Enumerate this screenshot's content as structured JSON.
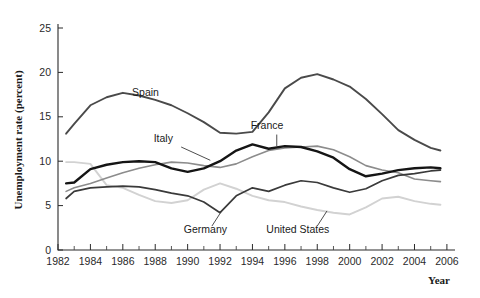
{
  "chart_data": {
    "type": "line",
    "title": "",
    "xlabel": "Year",
    "ylabel": "Unemployment rate (percent)",
    "xlim": [
      1982,
      2006.5
    ],
    "ylim": [
      0,
      25
    ],
    "yticks": [
      0,
      5,
      10,
      15,
      20,
      25
    ],
    "ytick_labels": [
      "0",
      "5",
      "10",
      "15",
      "20",
      "25"
    ],
    "xticks": [
      1982,
      1984,
      1986,
      1988,
      1990,
      1992,
      1994,
      1996,
      1998,
      2000,
      2002,
      2004,
      2006
    ],
    "xtick_labels": [
      "1982",
      "1984",
      "1986",
      "1988",
      "1990",
      "1992",
      "1994",
      "1996",
      "1998",
      "2000",
      "2002",
      "2004",
      "2006"
    ],
    "xtick_minor_step": 1,
    "grid": false,
    "legend_position": "inline-annotations",
    "x": [
      1982.5,
      1983,
      1984,
      1985,
      1986,
      1987,
      1988,
      1989,
      1990,
      1991,
      1992,
      1993,
      1994,
      1995,
      1996,
      1997,
      1998,
      1999,
      2000,
      2001,
      2002,
      2003,
      2004,
      2005,
      2005.6
    ],
    "series": [
      {
        "name": "Spain",
        "color": "#4a4a4a",
        "width": 1.9,
        "label": "Spain",
        "label_x": 1987.4,
        "label_y": 17.3,
        "values": [
          13.1,
          14.2,
          16.3,
          17.2,
          17.7,
          17.4,
          16.9,
          16.3,
          15.4,
          14.4,
          13.2,
          13.1,
          13.3,
          15.5,
          18.2,
          19.4,
          19.8,
          19.2,
          18.4,
          17.0,
          15.3,
          13.5,
          12.4,
          11.5,
          11.2
        ],
        "values_label_hint": "peaks 19.8 in 1994"
      },
      {
        "name": "Italy",
        "color": "#8c8c8c",
        "width": 1.6,
        "label": "Italy",
        "label_x": 1988.5,
        "label_y": 12.2,
        "values": [
          6.6,
          7.0,
          7.5,
          8.1,
          8.7,
          9.2,
          9.6,
          9.9,
          9.8,
          9.5,
          9.3,
          9.7,
          10.5,
          11.2,
          11.5,
          11.6,
          11.7,
          11.3,
          10.5,
          9.5,
          9.0,
          8.7,
          8.0,
          7.8,
          7.7
        ]
      },
      {
        "name": "France",
        "color": "#151515",
        "width": 2.4,
        "label": "France",
        "label_x": 1994.9,
        "label_y": 13.6,
        "values": [
          7.5,
          7.6,
          9.1,
          9.6,
          9.9,
          10.0,
          9.9,
          9.2,
          8.8,
          9.2,
          10.0,
          11.2,
          11.9,
          11.4,
          11.7,
          11.6,
          11.1,
          10.4,
          9.1,
          8.3,
          8.6,
          9.0,
          9.2,
          9.3,
          9.2
        ]
      },
      {
        "name": "Germany",
        "color": "#3a3a3a",
        "width": 1.7,
        "label": "Germany",
        "label_x": 1991.1,
        "label_y": 1.9,
        "values": [
          5.8,
          6.6,
          7.0,
          7.1,
          7.2,
          7.1,
          6.8,
          6.4,
          6.1,
          5.4,
          4.2,
          6.1,
          7.0,
          6.6,
          7.3,
          7.8,
          7.6,
          7.0,
          6.5,
          6.9,
          7.8,
          8.4,
          8.6,
          8.9,
          9.0
        ]
      },
      {
        "name": "United States",
        "color": "#d2d2d2",
        "width": 1.9,
        "label": "United States",
        "label_x": 1996.8,
        "label_y": 1.9,
        "values": [
          9.9,
          9.9,
          9.7,
          7.3,
          7.0,
          6.2,
          5.5,
          5.3,
          5.6,
          6.8,
          7.5,
          6.9,
          6.1,
          5.6,
          5.4,
          4.9,
          4.5,
          4.2,
          4.0,
          4.8,
          5.8,
          6.0,
          5.5,
          5.2,
          5.1
        ]
      }
    ],
    "annotations": [
      {
        "name": "spain-label",
        "text": "Spain",
        "leader": false
      },
      {
        "name": "italy-label",
        "text": "Italy",
        "leader": true
      },
      {
        "name": "france-label",
        "text": "France",
        "leader": true
      },
      {
        "name": "germany-label",
        "text": "Germany",
        "leader": true
      },
      {
        "name": "united-states-label",
        "text": "United States",
        "leader": true
      }
    ]
  }
}
